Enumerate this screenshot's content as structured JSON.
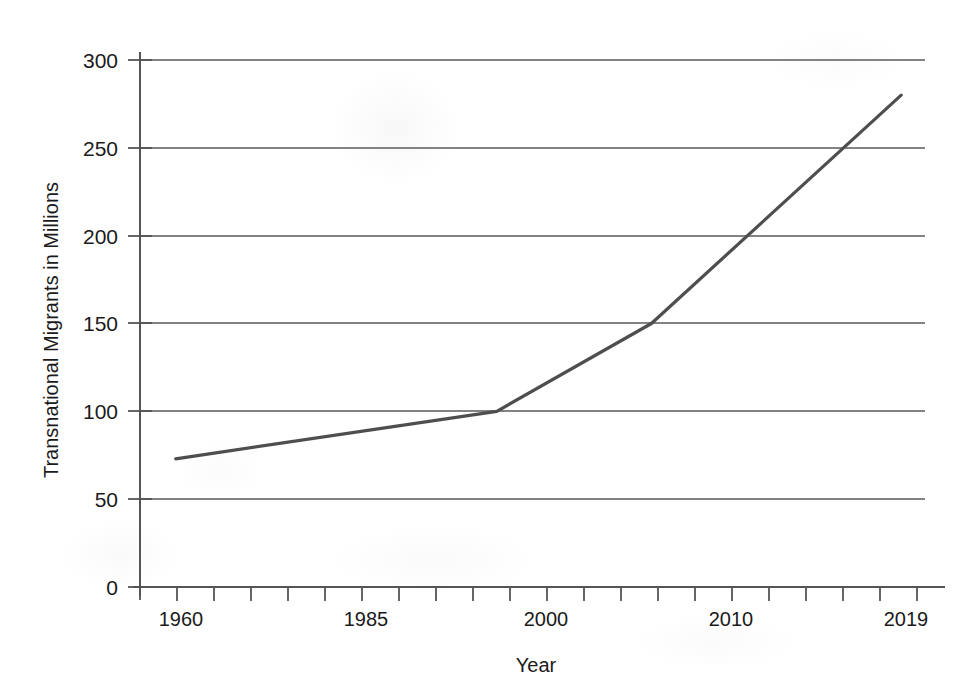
{
  "chart_data": {
    "type": "line",
    "title": "",
    "xlabel": "Year",
    "ylabel": "Transnational Migrants in Millions",
    "xlim": [
      1955,
      2021
    ],
    "ylim": [
      0,
      300
    ],
    "grid": true,
    "legend": "none",
    "y_ticks": [
      300,
      250,
      200,
      150,
      100,
      50,
      0
    ],
    "x_ticks": [
      1960,
      1985,
      2000,
      2010,
      2019
    ],
    "x_minor_tick_count": 22,
    "series": [
      {
        "name": "Transnational Migrants",
        "color": "#4e4e4e",
        "x": [
          1958,
          1985,
          1998,
          2019
        ],
        "values": [
          73,
          100,
          150,
          280
        ]
      }
    ],
    "points": [
      {
        "year": 1958,
        "value": 73
      },
      {
        "year": 1985,
        "value": 100
      },
      {
        "year": 1998,
        "value": 150
      },
      {
        "year": 2019,
        "value": 280
      }
    ]
  },
  "axes": {
    "y_axis": {
      "title": "Transnational Migrants in Millions",
      "ticks": [
        {
          "label": "300"
        },
        {
          "label": "250"
        },
        {
          "label": "200"
        },
        {
          "label": "150"
        },
        {
          "label": "100"
        },
        {
          "label": "50"
        },
        {
          "label": "0"
        }
      ]
    },
    "x_axis": {
      "title": "Year",
      "ticks": [
        {
          "label": "1960"
        },
        {
          "label": "1985"
        },
        {
          "label": "2000"
        },
        {
          "label": "2010"
        },
        {
          "label": "2019"
        }
      ]
    }
  },
  "style": {
    "line_color": "#4e4e4e",
    "grid_color": "#5a5a5a",
    "axis_color": "#555555",
    "background": "#ffffff",
    "text_color": "#1a1a1a"
  }
}
